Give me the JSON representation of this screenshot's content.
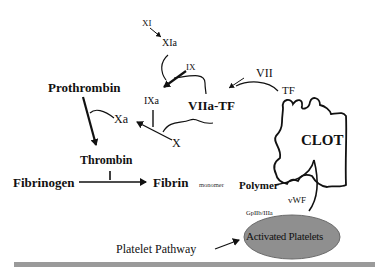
{
  "diagram": {
    "colors": {
      "line": "#111111",
      "platelet_fill": "#8f8f8f",
      "footer_bar": "#9a9a9a",
      "background": "#ffffff"
    },
    "nodes": {
      "xi": "XI",
      "xia": "XIa",
      "ix": "IX",
      "ixa": "IXa",
      "vii": "VII",
      "tf": "TF",
      "viia_tf": "VIIa-TF",
      "x": "X",
      "xa": "Xa",
      "prothrombin": "Prothrombin",
      "thrombin": "Thrombin",
      "fibrinogen": "Fibrinogen",
      "fibrin": "Fibrin",
      "monomer": "monomer",
      "polymer": "Polymer",
      "clot": "CLOT",
      "vwf": "vWF",
      "gpiib_iiia": "GpIIb/IIIa",
      "activated_platelets": "Activated Platelets",
      "platelet_pathway": "Platelet Pathway"
    },
    "edges": [
      {
        "from": "XI",
        "to": "XIa"
      },
      {
        "from": "XIa",
        "to": "IX→IXa",
        "type": "catalyzes"
      },
      {
        "from": "IX",
        "to": "IXa"
      },
      {
        "from": "VIIa-TF",
        "to": "IX→IXa",
        "type": "catalyzes"
      },
      {
        "from": "VII",
        "to": "VIIa-TF"
      },
      {
        "from": "TF",
        "to": "VIIa-TF",
        "type": "joins"
      },
      {
        "from": "X",
        "to": "Xa"
      },
      {
        "from": "IXa",
        "to": "X→Xa",
        "type": "catalyzes"
      },
      {
        "from": "VIIa-TF",
        "to": "X→Xa",
        "type": "catalyzes"
      },
      {
        "from": "Prothrombin",
        "to": "Thrombin"
      },
      {
        "from": "Xa",
        "to": "Prothrombin→Thrombin",
        "type": "catalyzes"
      },
      {
        "from": "Fibrinogen",
        "to": "Fibrin"
      },
      {
        "from": "Thrombin",
        "to": "Fibrinogen→Fibrin",
        "type": "catalyzes"
      },
      {
        "from": "Polymer",
        "to": "CLOT"
      },
      {
        "from": "Activated Platelets",
        "to": "CLOT",
        "via": "vWF"
      },
      {
        "from": "Platelet Pathway",
        "to": "Activated Platelets"
      }
    ]
  }
}
